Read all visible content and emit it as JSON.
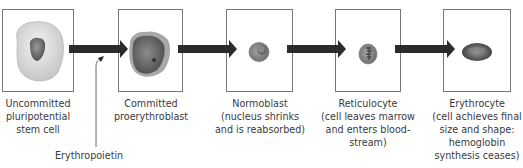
{
  "diagram": {
    "stages": [
      {
        "name": "Uncommitted",
        "lines": [
          "Uncommitted",
          "pluripotential",
          "stem cell"
        ]
      },
      {
        "name": "Committed proerythroblast",
        "lines": [
          "Committed",
          "proerythroblast"
        ]
      },
      {
        "name": "Normoblast",
        "lines": [
          "Normoblast",
          "(nucleus shrinks",
          "and is reabsorbed)"
        ]
      },
      {
        "name": "Reticulocyte",
        "lines": [
          "Reticulocyte",
          "(cell leaves marrow",
          "and enters blood-",
          "stream)"
        ]
      },
      {
        "name": "Erythrocyte",
        "lines": [
          "Erythrocyte",
          "(cell achieves final",
          "size and shape:",
          "hemoglobin",
          "synthesis ceases)"
        ]
      }
    ],
    "stimulus": {
      "label": "Erythropoietin"
    },
    "colors": {
      "arrow": "#2b2b2b",
      "box_border": "#777777",
      "stem_cell": "#d9d9d9",
      "nucleus": "#7a7a7a",
      "erythrocyte": "#6e6e6e"
    }
  }
}
